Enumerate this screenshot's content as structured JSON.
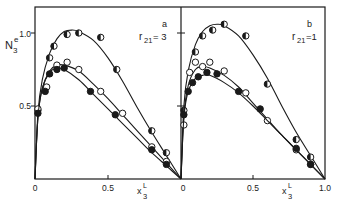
{
  "figure": {
    "ylabel_main": "N",
    "ylabel_sub": "3",
    "ylabel_sup": "e",
    "xlabel_main": "x",
    "xlabel_sub": "3",
    "xlabel_sup": "L",
    "colors": {
      "ink": "#1a1a1a",
      "background": "#ffffff"
    }
  },
  "chart_data": [
    {
      "type": "scatter",
      "panel": "a",
      "annotation": "r21 = 3",
      "panel_label": "a",
      "param_label": "r",
      "param_sub": "21",
      "param_value": "= 3",
      "xlabel": "x3^L",
      "ylabel": "N3^e",
      "xlim": [
        0,
        1.0
      ],
      "ylim": [
        0,
        1.2
      ],
      "x_ticks": [
        "0",
        "0.5"
      ],
      "y_ticks": [
        "0.5",
        "1.0"
      ],
      "grid": false,
      "series": [
        {
          "name": "half-filled circles",
          "marker": "half",
          "points": [
            [
              0.02,
              0.47
            ],
            [
              0.1,
              0.83
            ],
            [
              0.13,
              0.91
            ],
            [
              0.22,
              0.99
            ],
            [
              0.3,
              1.0
            ],
            [
              0.45,
              0.97
            ],
            [
              0.56,
              0.75
            ],
            [
              0.8,
              0.33
            ],
            [
              0.9,
              0.18
            ]
          ],
          "curve": [
            [
              0,
              0
            ],
            [
              0.02,
              0.45
            ],
            [
              0.05,
              0.68
            ],
            [
              0.1,
              0.86
            ],
            [
              0.15,
              0.96
            ],
            [
              0.2,
              1.01
            ],
            [
              0.25,
              1.02
            ],
            [
              0.3,
              1.01
            ],
            [
              0.4,
              0.95
            ],
            [
              0.5,
              0.83
            ],
            [
              0.6,
              0.67
            ],
            [
              0.7,
              0.49
            ],
            [
              0.8,
              0.32
            ],
            [
              0.9,
              0.16
            ],
            [
              1.0,
              0
            ]
          ]
        },
        {
          "name": "open circles",
          "marker": "open",
          "points": [
            [
              0.02,
              0.48
            ],
            [
              0.08,
              0.63
            ],
            [
              0.15,
              0.78
            ],
            [
              0.22,
              0.8
            ],
            [
              0.3,
              0.75
            ],
            [
              0.45,
              0.6
            ],
            [
              0.6,
              0.45
            ],
            [
              0.8,
              0.22
            ],
            [
              0.9,
              0.12
            ]
          ],
          "curve": [
            [
              0,
              0
            ],
            [
              0.02,
              0.42
            ],
            [
              0.05,
              0.62
            ],
            [
              0.1,
              0.74
            ],
            [
              0.15,
              0.78
            ],
            [
              0.2,
              0.78
            ],
            [
              0.3,
              0.74
            ],
            [
              0.4,
              0.65
            ],
            [
              0.5,
              0.55
            ],
            [
              0.6,
              0.44
            ],
            [
              0.7,
              0.33
            ],
            [
              0.8,
              0.22
            ],
            [
              0.9,
              0.11
            ],
            [
              1.0,
              0
            ]
          ]
        },
        {
          "name": "filled circles",
          "marker": "filled",
          "points": [
            [
              0.02,
              0.45
            ],
            [
              0.07,
              0.6
            ],
            [
              0.1,
              0.72
            ],
            [
              0.15,
              0.75
            ],
            [
              0.2,
              0.76
            ],
            [
              0.38,
              0.6
            ],
            [
              0.55,
              0.44
            ],
            [
              0.8,
              0.2
            ],
            [
              0.9,
              0.1
            ]
          ],
          "curve": [
            [
              0,
              0
            ],
            [
              0.02,
              0.42
            ],
            [
              0.05,
              0.62
            ],
            [
              0.1,
              0.73
            ],
            [
              0.15,
              0.76
            ],
            [
              0.2,
              0.75
            ],
            [
              0.3,
              0.68
            ],
            [
              0.4,
              0.58
            ],
            [
              0.5,
              0.48
            ],
            [
              0.6,
              0.38
            ],
            [
              0.7,
              0.28
            ],
            [
              0.8,
              0.18
            ],
            [
              0.9,
              0.09
            ],
            [
              1.0,
              0
            ]
          ]
        }
      ]
    },
    {
      "type": "scatter",
      "panel": "b",
      "annotation": "r21 = 1",
      "panel_label": "b",
      "param_label": "r",
      "param_sub": "21",
      "param_value": "=1",
      "xlabel": "x3^L",
      "ylabel": "N3^e",
      "xlim": [
        0,
        1.0
      ],
      "ylim": [
        0,
        1.2
      ],
      "x_ticks": [
        "0",
        "0.5",
        "1.0"
      ],
      "y_ticks": [
        "0.5",
        "1.0"
      ],
      "grid": false,
      "series": [
        {
          "name": "half-filled circles",
          "marker": "half",
          "points": [
            [
              0.02,
              0.47
            ],
            [
              0.1,
              0.87
            ],
            [
              0.15,
              0.98
            ],
            [
              0.22,
              1.02
            ],
            [
              0.3,
              1.06
            ],
            [
              0.45,
              0.98
            ],
            [
              0.6,
              0.65
            ],
            [
              0.8,
              0.27
            ],
            [
              0.9,
              0.15
            ]
          ],
          "curve": [
            [
              0,
              0
            ],
            [
              0.02,
              0.5
            ],
            [
              0.05,
              0.74
            ],
            [
              0.1,
              0.92
            ],
            [
              0.15,
              1.01
            ],
            [
              0.2,
              1.05
            ],
            [
              0.25,
              1.06
            ],
            [
              0.3,
              1.05
            ],
            [
              0.4,
              0.98
            ],
            [
              0.5,
              0.85
            ],
            [
              0.6,
              0.69
            ],
            [
              0.7,
              0.5
            ],
            [
              0.8,
              0.32
            ],
            [
              0.9,
              0.16
            ],
            [
              1.0,
              0
            ]
          ]
        },
        {
          "name": "open circles",
          "marker": "open",
          "points": [
            [
              0.02,
              0.37
            ],
            [
              0.06,
              0.73
            ],
            [
              0.1,
              0.8
            ],
            [
              0.15,
              0.77
            ],
            [
              0.2,
              0.8
            ],
            [
              0.3,
              0.74
            ],
            [
              0.45,
              0.59
            ],
            [
              0.6,
              0.4
            ],
            [
              0.8,
              0.2
            ],
            [
              0.9,
              0.1
            ]
          ],
          "curve": [
            [
              0,
              0
            ],
            [
              0.02,
              0.43
            ],
            [
              0.05,
              0.64
            ],
            [
              0.1,
              0.75
            ],
            [
              0.15,
              0.77
            ],
            [
              0.2,
              0.76
            ],
            [
              0.3,
              0.71
            ],
            [
              0.4,
              0.63
            ],
            [
              0.5,
              0.52
            ],
            [
              0.6,
              0.41
            ],
            [
              0.7,
              0.3
            ],
            [
              0.8,
              0.2
            ],
            [
              0.9,
              0.1
            ],
            [
              1.0,
              0
            ]
          ]
        },
        {
          "name": "filled circles",
          "marker": "filled",
          "points": [
            [
              0.02,
              0.44
            ],
            [
              0.05,
              0.6
            ],
            [
              0.08,
              0.66
            ],
            [
              0.12,
              0.7
            ],
            [
              0.18,
              0.73
            ],
            [
              0.25,
              0.72
            ],
            [
              0.4,
              0.6
            ],
            [
              0.55,
              0.48
            ],
            [
              0.8,
              0.21
            ],
            [
              0.9,
              0.1
            ]
          ],
          "curve": [
            [
              0,
              0
            ],
            [
              0.02,
              0.42
            ],
            [
              0.05,
              0.6
            ],
            [
              0.1,
              0.69
            ],
            [
              0.15,
              0.71
            ],
            [
              0.2,
              0.71
            ],
            [
              0.3,
              0.66
            ],
            [
              0.4,
              0.59
            ],
            [
              0.5,
              0.5
            ],
            [
              0.6,
              0.4
            ],
            [
              0.7,
              0.3
            ],
            [
              0.8,
              0.2
            ],
            [
              0.9,
              0.1
            ],
            [
              1.0,
              0
            ]
          ]
        }
      ]
    }
  ]
}
